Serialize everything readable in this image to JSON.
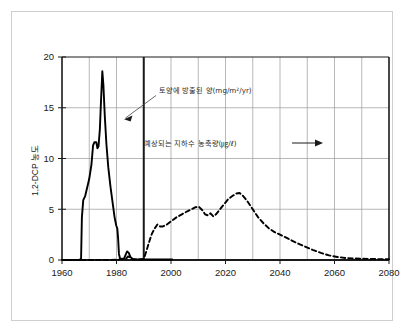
{
  "figure": {
    "background_color": "#ffffff",
    "frame_color": "#cfcfcf"
  },
  "chart_data": {
    "type": "line",
    "title": "",
    "subtitle": "",
    "xlabel": "",
    "ylabel": "1,2-DCP 농도",
    "xlim": [
      1960,
      2080
    ],
    "ylim": [
      0,
      20
    ],
    "grid": true,
    "grid_x_step": 10,
    "grid_y_step": 5,
    "legend_position": "inline-annotations",
    "xticks": [
      1960,
      1980,
      2000,
      2020,
      2040,
      2060,
      2080
    ],
    "xtick_labels": [
      "1960",
      "1980",
      "2000",
      "2020",
      "2040",
      "2060",
      "2080"
    ],
    "yticks": [
      0,
      5,
      10,
      15,
      20
    ],
    "ytick_labels": [
      "0",
      "5",
      "10",
      "15",
      "20"
    ],
    "series": [
      {
        "name": "토양에 방출된 양",
        "unit": "mg/m2/yr",
        "style": "solid",
        "color": "#000000",
        "points": [
          [
            1960,
            0.0
          ],
          [
            1966.5,
            0.0
          ],
          [
            1967,
            0.15
          ],
          [
            1967.3,
            4.2
          ],
          [
            1967.8,
            5.9
          ],
          [
            1968.5,
            6.3
          ],
          [
            1969.2,
            7.1
          ],
          [
            1970.0,
            8.0
          ],
          [
            1970.8,
            9.4
          ],
          [
            1971.4,
            11.3
          ],
          [
            1971.9,
            11.6
          ],
          [
            1972.6,
            11.6
          ],
          [
            1973.0,
            11.0
          ],
          [
            1973.4,
            11.2
          ],
          [
            1973.9,
            12.9
          ],
          [
            1974.3,
            15.6
          ],
          [
            1974.8,
            18.6
          ],
          [
            1975.2,
            17.2
          ],
          [
            1975.7,
            14.2
          ],
          [
            1976.3,
            11.4
          ],
          [
            1977.0,
            9.1
          ],
          [
            1977.8,
            7.2
          ],
          [
            1978.6,
            5.6
          ],
          [
            1979.3,
            4.2
          ],
          [
            1979.9,
            3.4
          ],
          [
            1980.3,
            3.1
          ],
          [
            1980.6,
            2.1
          ],
          [
            1980.9,
            0.6
          ],
          [
            1981.3,
            0.15
          ],
          [
            1982.0,
            0.1
          ],
          [
            1982.8,
            0.15
          ],
          [
            1983.4,
            0.55
          ],
          [
            1983.9,
            0.85
          ],
          [
            1984.5,
            0.7
          ],
          [
            1985.1,
            0.3
          ],
          [
            1985.8,
            0.1
          ],
          [
            1987.0,
            0.05
          ],
          [
            1990.0,
            0.05
          ],
          [
            2000.5,
            0.05
          ]
        ]
      },
      {
        "name": "예상되는 지하수 농축량",
        "unit": "ug/l",
        "style": "dashed",
        "color": "#000000",
        "points": [
          [
            1967,
            0.0
          ],
          [
            1980,
            0.02
          ],
          [
            1983.5,
            0.12
          ],
          [
            1984.2,
            0.35
          ],
          [
            1985.0,
            0.25
          ],
          [
            1986.0,
            0.08
          ],
          [
            1988.0,
            0.05
          ],
          [
            1990.0,
            0.1
          ],
          [
            1991.0,
            0.9
          ],
          [
            1992.0,
            1.8
          ],
          [
            1993.0,
            2.6
          ],
          [
            1994.0,
            3.1
          ],
          [
            1995.0,
            3.5
          ],
          [
            1996.0,
            3.3
          ],
          [
            1997.0,
            3.3
          ],
          [
            1998.5,
            3.5
          ],
          [
            2000.0,
            3.8
          ],
          [
            2002.0,
            4.2
          ],
          [
            2004.0,
            4.5
          ],
          [
            2006.0,
            4.8
          ],
          [
            2007.5,
            5.0
          ],
          [
            2009.0,
            5.2
          ],
          [
            2010.2,
            5.25
          ],
          [
            2011.5,
            4.9
          ],
          [
            2012.5,
            4.5
          ],
          [
            2013.5,
            4.4
          ],
          [
            2014.5,
            4.6
          ],
          [
            2015.5,
            4.3
          ],
          [
            2016.5,
            4.5
          ],
          [
            2018.0,
            5.0
          ],
          [
            2019.5,
            5.5
          ],
          [
            2021.0,
            6.0
          ],
          [
            2022.5,
            6.3
          ],
          [
            2024.0,
            6.55
          ],
          [
            2025.2,
            6.6
          ],
          [
            2026.5,
            6.3
          ],
          [
            2028.0,
            5.8
          ],
          [
            2030.0,
            5.0
          ],
          [
            2032.0,
            4.2
          ],
          [
            2034.0,
            3.6
          ],
          [
            2036.0,
            3.1
          ],
          [
            2038.0,
            2.75
          ],
          [
            2040.0,
            2.5
          ],
          [
            2043.0,
            2.1
          ],
          [
            2046.0,
            1.7
          ],
          [
            2049.0,
            1.35
          ],
          [
            2052.0,
            1.0
          ],
          [
            2055.0,
            0.7
          ],
          [
            2058.0,
            0.45
          ],
          [
            2061.0,
            0.3
          ],
          [
            2064.0,
            0.2
          ],
          [
            2067.0,
            0.15
          ],
          [
            2070.0,
            0.12
          ],
          [
            2074.0,
            0.1
          ],
          [
            2078.0,
            0.08
          ],
          [
            2080.0,
            0.07
          ]
        ]
      }
    ],
    "annotations": [
      {
        "id": "soil-emission-label",
        "text": "토양에 방출된 양(mg/m²/yr)",
        "arrow": "down-left"
      },
      {
        "id": "groundwater-label",
        "text": "예상되는 지하수 농축량(㎍/ℓ)",
        "arrow": "right"
      }
    ],
    "reference_lines": [
      {
        "id": "year-1990-marker",
        "x": 1990,
        "style": "solid-heavy"
      }
    ]
  }
}
